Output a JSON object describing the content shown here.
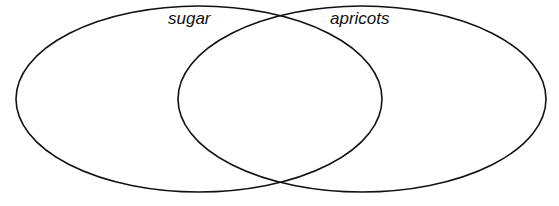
{
  "diagram": {
    "type": "venn",
    "stroke_color": "#111111",
    "background": "#ffffff",
    "sets": [
      {
        "id": "left",
        "label": "sugar",
        "cx": 199,
        "cy": 99,
        "rx": 183,
        "ry": 93
      },
      {
        "id": "right",
        "label": "apricots",
        "cx": 362,
        "cy": 99,
        "rx": 184,
        "ry": 93
      }
    ]
  }
}
